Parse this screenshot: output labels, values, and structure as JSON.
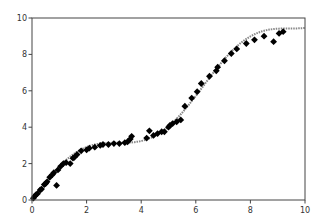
{
  "chart_data": {
    "type": "scatter",
    "title": "",
    "xlabel": "",
    "ylabel": "",
    "xlim": [
      0,
      10
    ],
    "ylim": [
      0,
      10
    ],
    "grid": false,
    "legend": null,
    "xticks": [
      0,
      2,
      4,
      6,
      8,
      10
    ],
    "yticks": [
      0,
      2,
      4,
      6,
      8,
      10
    ],
    "xtick_labels": [
      "0",
      "2",
      "4",
      "6",
      "8",
      "10"
    ],
    "ytick_labels": [
      "0",
      "2",
      "4",
      "6",
      "8",
      "10"
    ],
    "series": [
      {
        "name": "fit curve",
        "kind": "line",
        "color": "#888888",
        "style": "dotted",
        "function": "y = x + sin(x)",
        "x": [
          0,
          0.5,
          1,
          1.5,
          2,
          2.5,
          3,
          3.5,
          4,
          4.5,
          5,
          5.5,
          6,
          6.5,
          7,
          7.5,
          8,
          8.5,
          9,
          9.5,
          10
        ],
        "y": [
          0,
          0.98,
          1.84,
          2.5,
          2.91,
          3.1,
          3.14,
          3.15,
          3.24,
          3.52,
          4.04,
          4.79,
          5.72,
          6.72,
          7.66,
          8.44,
          8.99,
          9.3,
          9.41,
          9.43,
          9.46
        ]
      },
      {
        "name": "data points",
        "kind": "scatter",
        "marker": "diamond",
        "color": "#000000",
        "x": [
          0.05,
          0.1,
          0.15,
          0.2,
          0.3,
          0.35,
          0.45,
          0.5,
          0.55,
          0.65,
          0.75,
          0.8,
          0.9,
          0.95,
          1.05,
          1.15,
          1.25,
          1.4,
          1.5,
          1.55,
          1.65,
          1.8,
          2.0,
          2.1,
          2.3,
          2.5,
          2.6,
          2.8,
          3.0,
          3.2,
          3.4,
          3.5,
          3.6,
          3.65,
          4.2,
          4.3,
          4.45,
          4.6,
          4.75,
          4.85,
          5.0,
          5.05,
          5.15,
          5.3,
          5.45,
          5.6,
          5.85,
          6.05,
          6.2,
          6.5,
          6.75,
          6.8,
          7.05,
          7.3,
          7.5,
          7.85,
          8.15,
          8.5,
          8.85,
          9.05,
          9.2
        ],
        "y": [
          0.1,
          0.2,
          0.3,
          0.35,
          0.55,
          0.6,
          0.85,
          0.9,
          1.0,
          1.25,
          1.4,
          1.5,
          0.8,
          1.65,
          1.85,
          2.0,
          2.05,
          2.0,
          2.3,
          2.35,
          2.5,
          2.7,
          2.75,
          2.85,
          2.9,
          3.0,
          3.05,
          3.05,
          3.1,
          3.1,
          3.15,
          3.2,
          3.35,
          3.5,
          3.4,
          3.8,
          3.55,
          3.65,
          3.75,
          3.75,
          4.0,
          4.1,
          4.2,
          4.3,
          4.4,
          5.15,
          5.6,
          5.95,
          6.4,
          6.8,
          7.1,
          7.3,
          7.65,
          8.05,
          8.3,
          8.6,
          8.8,
          9.0,
          8.7,
          9.15,
          9.25
        ]
      }
    ]
  }
}
